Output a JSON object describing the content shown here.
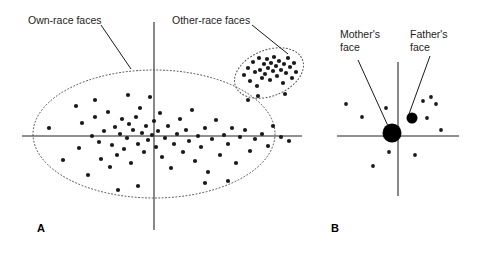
{
  "figure": {
    "type": "scatter-diagram",
    "background": "#ffffff",
    "ink": "#1a1a1a",
    "axis_color": "#6b6b6b"
  },
  "panels": [
    {
      "id": "A",
      "label": "A",
      "annotations": [
        {
          "id": "own-race",
          "text": "Own-race faces"
        },
        {
          "id": "other-race",
          "text": "Other-race faces"
        }
      ]
    },
    {
      "id": "B",
      "label": "B",
      "annotations": [
        {
          "id": "mothers-face",
          "text": "Mother's\nface"
        },
        {
          "id": "fathers-face",
          "text": "Father's\nface"
        }
      ]
    }
  ],
  "chart_data": [
    {
      "type": "scatter",
      "panel": "A",
      "title": "Own-race faces",
      "xlabel": "",
      "ylabel": "",
      "grid": false,
      "legend": "none",
      "axes": {
        "x_axis_y": 136,
        "y_axis_x": 154,
        "x_range_px": [
          22,
          302
        ],
        "y_range_px": [
          22,
          230
        ]
      },
      "clusters": [
        {
          "name": "Own-race faces",
          "boundary": {
            "shape": "ellipse",
            "cx": 154,
            "cy": 134,
            "rx": 121,
            "ry": 64,
            "rotation": 0,
            "stroke": "dotted"
          },
          "points": [
            [
              49,
              128
            ],
            [
              63,
              160
            ],
            [
              76,
              106
            ],
            [
              79,
              148
            ],
            [
              82,
              123
            ],
            [
              88,
              175
            ],
            [
              92,
              136
            ],
            [
              95,
              117
            ],
            [
              99,
              142
            ],
            [
              101,
              159
            ],
            [
              104,
              131
            ],
            [
              108,
              112
            ],
            [
              110,
              167
            ],
            [
              112,
              145
            ],
            [
              115,
              127
            ],
            [
              117,
              155
            ],
            [
              120,
              134
            ],
            [
              122,
              119
            ],
            [
              124,
              149
            ],
            [
              127,
              138
            ],
            [
              129,
              124
            ],
            [
              131,
              163
            ],
            [
              133,
              130
            ],
            [
              136,
              117
            ],
            [
              138,
              144
            ],
            [
              140,
              108
            ],
            [
              142,
              133
            ],
            [
              144,
              152
            ],
            [
              146,
              126
            ],
            [
              148,
              140
            ],
            [
              150,
              97
            ],
            [
              152,
              135
            ],
            [
              154,
              121
            ],
            [
              156,
              147
            ],
            [
              158,
              131
            ],
            [
              160,
              113
            ],
            [
              162,
              157
            ],
            [
              165,
              138
            ],
            [
              168,
              126
            ],
            [
              171,
              168
            ],
            [
              174,
              144
            ],
            [
              177,
              134
            ],
            [
              180,
              119
            ],
            [
              183,
              152
            ],
            [
              186,
              130
            ],
            [
              189,
              141
            ],
            [
              192,
              110
            ],
            [
              195,
              161
            ],
            [
              198,
              136
            ],
            [
              201,
              147
            ],
            [
              205,
              128
            ],
            [
              208,
              172
            ],
            [
              212,
              139
            ],
            [
              216,
              120
            ],
            [
              220,
              155
            ],
            [
              224,
              135
            ],
            [
              228,
              144
            ],
            [
              232,
              128
            ],
            [
              236,
              163
            ],
            [
              240,
              137
            ],
            [
              245,
              130
            ],
            [
              250,
              151
            ],
            [
              255,
              139
            ],
            [
              262,
              134
            ],
            [
              268,
              146
            ],
            [
              273,
              126
            ],
            [
              281,
              137
            ],
            [
              289,
              141
            ],
            [
              118,
              190
            ],
            [
              138,
              186
            ],
            [
              205,
              183
            ],
            [
              228,
              181
            ],
            [
              95,
              100
            ],
            [
              128,
              95
            ]
          ]
        },
        {
          "name": "Other-race faces",
          "boundary": {
            "shape": "ellipse",
            "cx": 269,
            "cy": 73,
            "rx": 36,
            "ry": 23,
            "rotation": -22,
            "stroke": "dotted"
          },
          "points": [
            [
              244,
              75
            ],
            [
              248,
              68
            ],
            [
              250,
              81
            ],
            [
              253,
              62
            ],
            [
              255,
              72
            ],
            [
              257,
              86
            ],
            [
              259,
              58
            ],
            [
              260,
              70
            ],
            [
              262,
              78
            ],
            [
              264,
              64
            ],
            [
              265,
              74
            ],
            [
              267,
              59
            ],
            [
              268,
              68
            ],
            [
              270,
              80
            ],
            [
              271,
              63
            ],
            [
              273,
              71
            ],
            [
              274,
              57
            ],
            [
              276,
              66
            ],
            [
              277,
              76
            ],
            [
              279,
              61
            ],
            [
              281,
              70
            ],
            [
              283,
              83
            ],
            [
              284,
              64
            ],
            [
              286,
              73
            ],
            [
              288,
              58
            ],
            [
              290,
              67
            ],
            [
              292,
              78
            ],
            [
              294,
              63
            ],
            [
              296,
              72
            ],
            [
              285,
              94
            ],
            [
              258,
              96
            ],
            [
              248,
              100
            ]
          ]
        }
      ],
      "annotation_lines": [
        {
          "label": "Own-race faces",
          "from": [
            101,
            25
          ],
          "to": [
            131,
            69
          ]
        },
        {
          "label": "Other-race faces",
          "from": [
            252,
            25
          ],
          "to": [
            288,
            54
          ]
        }
      ]
    },
    {
      "type": "scatter",
      "panel": "B",
      "title": "Infant face space",
      "xlabel": "",
      "ylabel": "",
      "grid": false,
      "legend": "none",
      "axes": {
        "x_axis_y": 136,
        "y_axis_x": 398,
        "x_range_px": [
          337,
          459
        ],
        "y_range_px": [
          62,
          196
        ]
      },
      "highlighted_points": [
        {
          "name": "Mother's face",
          "x": 392,
          "y": 133,
          "r": 9.5
        },
        {
          "name": "Father's face",
          "x": 412,
          "y": 118,
          "r": 5.5
        }
      ],
      "points": [
        [
          346,
          104
        ],
        [
          362,
          117
        ],
        [
          386,
          108
        ],
        [
          389,
          152
        ],
        [
          373,
          166
        ],
        [
          423,
          101
        ],
        [
          431,
          97
        ],
        [
          436,
          104
        ],
        [
          441,
          130
        ],
        [
          415,
          155
        ],
        [
          427,
          118
        ]
      ],
      "annotation_lines": [
        {
          "label": "Mother's face",
          "from": [
            358,
            60
          ],
          "to": [
            388,
            126
          ]
        },
        {
          "label": "Father's face",
          "from": [
            430,
            56
          ],
          "to": [
            409,
            114
          ]
        }
      ]
    }
  ]
}
